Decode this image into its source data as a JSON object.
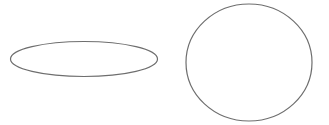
{
  "figure": {
    "background_color": "#ffffff",
    "width": 329,
    "height": 125,
    "stroke_color": "#6e6e6e",
    "stroke_width": 1.2,
    "fill": "none",
    "watermark": {
      "text": "",
      "color": "#fcfcfc",
      "visible": false,
      "legible": false
    },
    "shapes": [
      {
        "name": "flat-ellipse",
        "type": "ellipse",
        "cx": 84,
        "cy": 59,
        "rx": 73.5,
        "ry": 17.5,
        "stroke_color": "#6e6e6e",
        "stroke_width": 1.2,
        "fill": "none"
      },
      {
        "name": "circle",
        "type": "ellipse",
        "cx": 249,
        "cy": 62.5,
        "rx": 63,
        "ry": 58.5,
        "stroke_color": "#6e6e6e",
        "stroke_width": 1.2,
        "fill": "none"
      }
    ]
  }
}
